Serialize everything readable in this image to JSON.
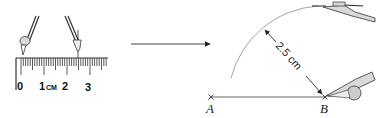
{
  "figure": {
    "left_panel": {
      "ruler": {
        "labels": [
          "0",
          "1",
          "2",
          "3"
        ],
        "unit": "CM"
      }
    },
    "transition_arrow": "right-arrow",
    "right_panel": {
      "points": [
        {
          "label": "A"
        },
        {
          "label": "B"
        }
      ],
      "radius_label": "2.5 cm"
    },
    "colors": {
      "line": "#555555",
      "ruler_fill": "#ffffff",
      "compass_fill": "#d9d9d9",
      "arc": "#999999"
    }
  }
}
